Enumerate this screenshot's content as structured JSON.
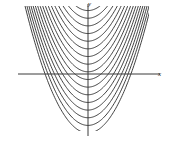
{
  "figure": {
    "title": "",
    "background_color": "#ffffff",
    "width": 171,
    "height": 141
  },
  "axes": {
    "x_label": "x",
    "y_label": "y",
    "x_axis_color": "#3a3a3a",
    "y_axis_color": "#3a3a3a",
    "origin_px": {
      "x": 88,
      "y": 74
    },
    "x_axis_extent_px": {
      "start": 18,
      "end": 160
    },
    "y_axis_extent_px": {
      "start": 4,
      "end": 136
    }
  },
  "chart_data": {
    "type": "line",
    "title": "",
    "xlabel": "x",
    "ylabel": "y",
    "grid": false,
    "legend": null,
    "xlim": [
      -3.5,
      3.5
    ],
    "ylim": [
      -3.2,
      3.2
    ],
    "curve_color": "#2b2b2b",
    "curve_width": 0.9,
    "n_curves": 17,
    "curve_form": "y = c + a*x*x",
    "curvature_a": 0.62,
    "series": [
      {
        "name": "c = 2.90",
        "c": 2.9,
        "values": []
      },
      {
        "name": "c = 2.55",
        "c": 2.55,
        "values": []
      },
      {
        "name": "c = 2.20",
        "c": 2.2,
        "values": []
      },
      {
        "name": "c = 1.85",
        "c": 1.85,
        "values": []
      },
      {
        "name": "c = 1.50",
        "c": 1.5,
        "values": []
      },
      {
        "name": "c = 1.15",
        "c": 1.15,
        "values": []
      },
      {
        "name": "c = 0.80",
        "c": 0.8,
        "values": []
      },
      {
        "name": "c = 0.45",
        "c": 0.45,
        "values": []
      },
      {
        "name": "c = 0.10",
        "c": 0.1,
        "values": []
      },
      {
        "name": "c = -0.25",
        "c": -0.25,
        "values": []
      },
      {
        "name": "c = -0.60",
        "c": -0.6,
        "values": []
      },
      {
        "name": "c = -0.95",
        "c": -0.95,
        "values": []
      },
      {
        "name": "c = -1.30",
        "c": -1.3,
        "values": []
      },
      {
        "name": "c = -1.65",
        "c": -1.65,
        "values": []
      },
      {
        "name": "c = -2.00",
        "c": -2.0,
        "values": []
      },
      {
        "name": "c = -2.35",
        "c": -2.35,
        "values": []
      },
      {
        "name": "c = -2.70",
        "c": -2.7,
        "values": []
      }
    ]
  }
}
